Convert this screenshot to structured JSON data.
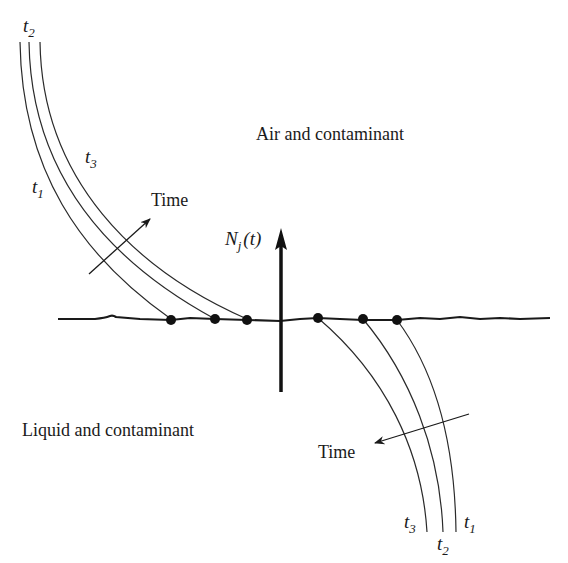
{
  "diagram": {
    "regions": {
      "upper_label": "Air and contaminant",
      "lower_label": "Liquid and contaminant"
    },
    "flux": {
      "symbol": "N",
      "subscript": "j",
      "argument": "(t)"
    },
    "upper_profiles": {
      "time_arrow_label": "Time",
      "curves": [
        {
          "label": "t",
          "sub": "1",
          "order": 1
        },
        {
          "label": "t",
          "sub": "2",
          "order": 2
        },
        {
          "label": "t",
          "sub": "3",
          "order": 3
        }
      ]
    },
    "lower_profiles": {
      "time_arrow_label": "Time",
      "curves": [
        {
          "label": "t",
          "sub": "3",
          "order": 3
        },
        {
          "label": "t",
          "sub": "2",
          "order": 2
        },
        {
          "label": "t",
          "sub": "1",
          "order": 1
        }
      ]
    },
    "colors": {
      "line": "#1a1a1a",
      "background": "#ffffff"
    }
  }
}
